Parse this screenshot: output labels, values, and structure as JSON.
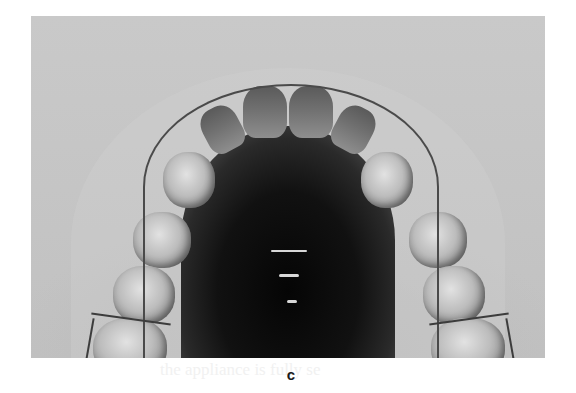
{
  "figure": {
    "panel_label": "c",
    "bleed_through_text": "the appliance is fully se",
    "colors": {
      "page_background": "#ffffff",
      "photo_background": "#c4c4c4",
      "palate": "#0a0a0a",
      "teeth": "#bdbdbd",
      "label": "#1a1a1a"
    }
  }
}
